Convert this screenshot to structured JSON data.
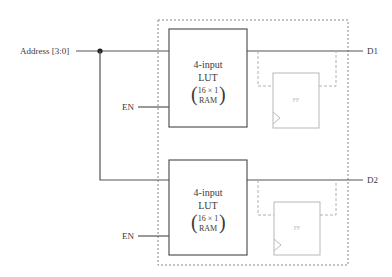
{
  "inputs": {
    "address_label": "Address [3:0]",
    "enable_label_1": "EN",
    "enable_label_2": "EN"
  },
  "outputs": {
    "d1_label": "D1",
    "d2_label": "D2"
  },
  "lut_1": {
    "line1": "4-input",
    "line2": "LUT",
    "line3": "16 × 1",
    "line4": "RAM"
  },
  "lut_2": {
    "line1": "4-input",
    "line2": "LUT",
    "line3": "16 × 1",
    "line4": "RAM"
  },
  "ff_1": {
    "label": "FF"
  },
  "ff_2": {
    "label": "FF"
  },
  "colors": {
    "wire": "#555555",
    "ff_faded": "#b8b8b8",
    "dashed_border": "#888888"
  }
}
